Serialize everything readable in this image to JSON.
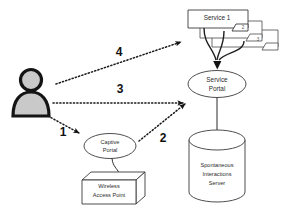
{
  "diagram": {
    "background_color": "#ffffff",
    "stroke_color": "#2a2a2a",
    "fill_color": "#ffffff",
    "person_fill": "#c9c9c9"
  },
  "nodes": {
    "user": {
      "name": "user-actor",
      "label": ""
    },
    "service1": {
      "label": "Service 1",
      "shape": "rectangle"
    },
    "service2": {
      "label": "",
      "badge": "2",
      "shape": "rectangle"
    },
    "service3": {
      "label": "",
      "badge": "3",
      "shape": "rectangle"
    },
    "service_portal": {
      "label_line1": "Service",
      "label_line2": "Portal",
      "shape": "ellipse"
    },
    "captive_portal": {
      "label_line1": "Captive",
      "label_line2": "Portal",
      "shape": "ellipse"
    },
    "wireless_ap": {
      "label_line1": "Wireless",
      "label_line2": "Access Point",
      "shape": "box3d"
    },
    "si_server": {
      "label_line1": "Spontaneous",
      "label_line2": "Interactions",
      "label_line3": "Server",
      "shape": "cylinder"
    }
  },
  "steps": [
    {
      "number": "1",
      "from": "user",
      "to": "captive_portal",
      "style": "dotted"
    },
    {
      "number": "2",
      "from": "captive_portal",
      "to": "service_portal",
      "style": "dotted"
    },
    {
      "number": "3",
      "from": "user",
      "to": "service_portal",
      "style": "dotted"
    },
    {
      "number": "4",
      "from": "user",
      "to": "service1",
      "style": "dotted"
    }
  ]
}
